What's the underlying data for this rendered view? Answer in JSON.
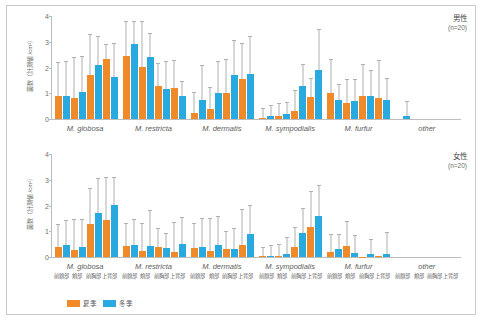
{
  "figure": {
    "y_axis_label": "菌数（計測値 /cm²）",
    "legend": [
      {
        "label": "夏季",
        "color": "#F08A28",
        "key": "summer"
      },
      {
        "label": "冬季",
        "color": "#28A9E0",
        "key": "winter"
      }
    ],
    "sites": [
      "前額部",
      "頬部",
      "前胸部",
      "上背部"
    ],
    "species": [
      "M. globosa",
      "M. restricta",
      "M. dermatis",
      "M. sympodialis",
      "M. furfur",
      "other"
    ]
  },
  "chart_data": {
    "type": "bar",
    "title": "",
    "xlabel": "",
    "ylabel": "菌数（計測値 /cm²）",
    "ylim": [
      0,
      4
    ],
    "yticks": [
      0,
      1,
      2,
      3,
      4
    ],
    "grid": false,
    "legend_position": "bottom-left",
    "categories": [
      "M. globosa",
      "M. restricta",
      "M. dermatis",
      "M. sympodialis",
      "M. furfur",
      "other"
    ],
    "subcategories": [
      "前額部",
      "頬部",
      "前胸部",
      "上背部"
    ],
    "panels": [
      {
        "name": "male",
        "label": "男性",
        "n_label": "(n=20)",
        "series": [
          {
            "name": "夏季",
            "key": "summer",
            "color": "#F08A28",
            "values": [
              [
                0.9,
                0.82,
                1.72,
                2.33
              ],
              [
                2.45,
                2.02,
                1.3,
                1.22
              ],
              [
                0.22,
                0.38,
                1.0,
                1.57
              ],
              [
                0.03,
                0.12,
                0.33,
                0.85
              ],
              [
                1.0,
                0.62,
                0.88,
                0.82
              ],
              [
                0.0,
                0.0,
                0.0,
                0.0
              ]
            ],
            "errors": [
              [
                1.28,
                1.55,
                1.55,
                0.55
              ],
              [
                1.3,
                1.75,
                0.85,
                1.05
              ],
              [
                0.78,
                0.82,
                1.3,
                1.35
              ],
              [
                0.35,
                0.48,
                0.75,
                0.72
              ],
              [
                1.3,
                0.88,
                1.22,
                1.42
              ],
              [
                0.0,
                0.0,
                0.0,
                0.0
              ]
            ]
          },
          {
            "name": "冬季",
            "key": "winter",
            "color": "#28A9E0",
            "values": [
              [
                0.88,
                1.05,
                2.1,
                1.63
              ],
              [
                2.9,
                2.4,
                1.15,
                0.88
              ],
              [
                0.73,
                1.02,
                1.7,
                1.75
              ],
              [
                0.1,
                0.18,
                1.3,
                1.9
              ],
              [
                0.72,
                0.7,
                0.9,
                0.72
              ],
              [
                0.13,
                0.0,
                0.0,
                0.0
              ]
            ],
            "errors": [
              [
                1.32,
                1.35,
                1.1,
                1.28
              ],
              [
                0.88,
                0.92,
                1.05,
                0.55
              ],
              [
                1.32,
                1.18,
                1.33,
                1.45
              ],
              [
                0.4,
                0.45,
                0.8,
                1.55
              ],
              [
                0.62,
                0.8,
                0.95,
                0.85
              ],
              [
                0.55,
                0.0,
                0.0,
                0.0
              ]
            ]
          }
        ]
      },
      {
        "name": "female",
        "label": "女性",
        "n_label": "(n=20)",
        "series": [
          {
            "name": "夏季",
            "key": "summer",
            "color": "#F08A28",
            "values": [
              [
                0.38,
                0.27,
                1.3,
                1.45
              ],
              [
                0.43,
                0.22,
                0.38,
                0.2
              ],
              [
                0.35,
                0.22,
                0.3,
                0.48
              ],
              [
                0.03,
                0.05,
                0.38,
                1.18
              ],
              [
                0.18,
                0.42,
                0.02,
                0.03
              ],
              [
                0.0,
                0.0,
                0.0,
                0.0
              ]
            ],
            "errors": [
              [
                0.85,
                1.18,
                1.35,
                1.6
              ],
              [
                0.85,
                1.08,
                0.72,
                1.12
              ],
              [
                0.95,
                1.25,
                0.68,
                1.35
              ],
              [
                0.32,
                0.4,
                0.75,
                1.35
              ],
              [
                0.68,
                0.95,
                0.0,
                0.0
              ],
              [
                0.0,
                0.0,
                0.0,
                0.0
              ]
            ]
          },
          {
            "name": "冬季",
            "key": "winter",
            "color": "#28A9E0",
            "values": [
              [
                0.47,
                0.4,
                1.72,
                2.03
              ],
              [
                0.45,
                0.42,
                0.35,
                0.52
              ],
              [
                0.38,
                0.47,
                0.33,
                0.88
              ],
              [
                0.05,
                0.13,
                0.95,
                1.6
              ],
              [
                0.3,
                0.17,
                0.13,
                0.13
              ],
              [
                0.0,
                0.0,
                0.0,
                0.0
              ]
            ],
            "errors": [
              [
                0.92,
                1.05,
                1.3,
                1.05
              ],
              [
                1.0,
                1.35,
                0.55,
                1.0
              ],
              [
                1.1,
                1.1,
                0.75,
                1.1
              ],
              [
                0.38,
                0.6,
                0.92,
                1.15
              ],
              [
                0.55,
                0.65,
                0.55,
                0.82
              ],
              [
                0.0,
                0.0,
                0.0,
                0.0
              ]
            ]
          }
        ]
      }
    ]
  }
}
